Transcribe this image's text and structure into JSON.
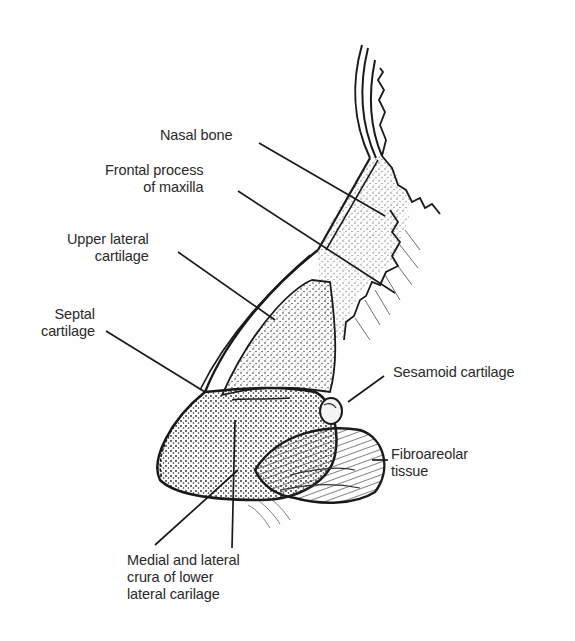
{
  "figure": {
    "labels": [
      {
        "id": "nasal-bone",
        "text": "Nasal bone"
      },
      {
        "id": "frontal-process",
        "text": "Frontal process\nof maxilla"
      },
      {
        "id": "upper-lateral",
        "text": "Upper lateral\ncartilage"
      },
      {
        "id": "septal",
        "text": "Septal\ncartilage"
      },
      {
        "id": "sesamoid",
        "text": "Sesamoid cartilage"
      },
      {
        "id": "fibroareolar",
        "text": "Fibroareolar\ntissue"
      },
      {
        "id": "crura",
        "text": "Medial and lateral\ncrura of lower\nlateral carilage"
      }
    ],
    "colors": {
      "ink": "#1a1a1a",
      "background": "#fefefe",
      "label": "#2a2a2a"
    }
  }
}
